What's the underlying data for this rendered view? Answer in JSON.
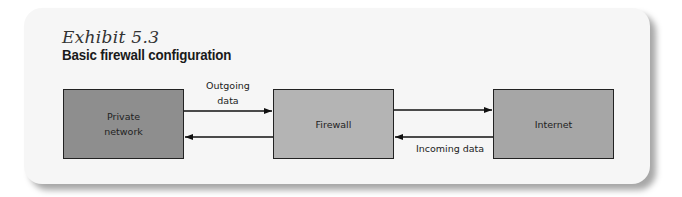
{
  "exhibit": {
    "number_label": "Exhibit 5.3",
    "title": "Basic firewall configuration"
  },
  "diagram": {
    "nodes": [
      {
        "id": "private",
        "label_line1": "Private",
        "label_line2": "network",
        "color": "#8e8e8e"
      },
      {
        "id": "firewall",
        "label": "Firewall",
        "color": "#b4b4b4"
      },
      {
        "id": "internet",
        "label": "Internet",
        "color": "#a6a6a6"
      }
    ],
    "edge_labels": {
      "outgoing_line1": "Outgoing",
      "outgoing_line2": "data",
      "incoming": "Incoming data"
    },
    "edges": [
      {
        "from": "private",
        "to": "firewall",
        "label": "Outgoing data"
      },
      {
        "from": "firewall",
        "to": "internet",
        "label": ""
      },
      {
        "from": "internet",
        "to": "firewall",
        "label": "Incoming data"
      },
      {
        "from": "firewall",
        "to": "private",
        "label": ""
      }
    ]
  }
}
